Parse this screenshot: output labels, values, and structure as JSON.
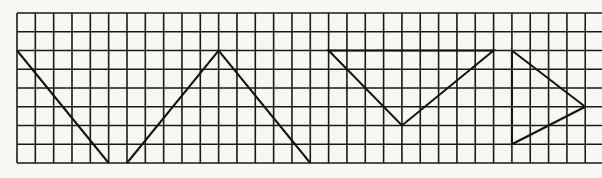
{
  "grid": {
    "origin_x": 17,
    "origin_y": 13,
    "cell_w": 18.33,
    "cell_h": 18.75,
    "cols": 31,
    "rows": 8,
    "extend_right_to": 602,
    "line_color": "#1a1a1a",
    "background": "#f7f7f5"
  },
  "shapes": [
    {
      "name": "diagonal-line",
      "type": "polyline",
      "points": [
        [
          0,
          2
        ],
        [
          5,
          8
        ]
      ]
    },
    {
      "name": "peak-polyline",
      "type": "polyline",
      "points": [
        [
          6,
          8
        ],
        [
          11,
          2
        ],
        [
          16,
          8
        ]
      ]
    },
    {
      "name": "inverted-triangle",
      "type": "polygon",
      "points": [
        [
          17,
          2
        ],
        [
          26,
          2
        ],
        [
          21,
          6
        ]
      ]
    },
    {
      "name": "right-pointing-triangle",
      "type": "polygon",
      "points": [
        [
          27,
          2
        ],
        [
          31,
          5
        ],
        [
          27,
          7
        ]
      ]
    }
  ],
  "stroke": {
    "color": "#111111",
    "width": 2
  }
}
